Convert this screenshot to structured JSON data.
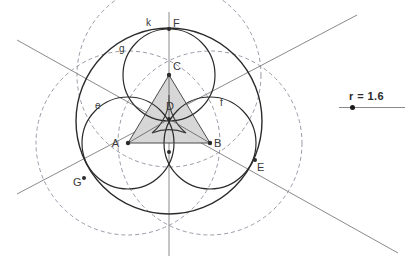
{
  "figure": {
    "background_color": "#ffffff",
    "stroke_color": "#2b2b2b",
    "dashed_color": "#9a9aa8",
    "line_color": "#8a8a8a",
    "fill_color": "#d6d6d6",
    "point_labels": [
      {
        "name": "A",
        "x": 128,
        "y": 143,
        "label_x": 119,
        "label_y": 147
      },
      {
        "name": "B",
        "x": 210,
        "y": 143,
        "label_x": 214,
        "label_y": 147
      },
      {
        "name": "C",
        "x": 169,
        "y": 75,
        "label_x": 172,
        "label_y": 70
      },
      {
        "name": "D",
        "x": 169,
        "y": 119,
        "label_x": 166,
        "label_y": 110
      },
      {
        "name": "E",
        "x": 255,
        "y": 160,
        "label_x": 256,
        "label_y": 170
      },
      {
        "name": "F",
        "x": 169,
        "y": 29,
        "label_x": 172,
        "label_y": 26
      },
      {
        "name": "G",
        "x": 84,
        "y": 178,
        "label_x": 74,
        "label_y": 185
      }
    ],
    "object_labels": [
      {
        "name": "k",
        "x": 146,
        "y": 25
      },
      {
        "name": "g",
        "x": 120,
        "y": 50
      },
      {
        "name": "e",
        "x": 97,
        "y": 108
      },
      {
        "name": "f",
        "x": 221,
        "y": 105
      }
    ],
    "circles_solid": [
      {
        "name": "k",
        "cx": 169,
        "cy": 121,
        "r": 93
      },
      {
        "name": "g",
        "cx": 169,
        "cy": 75,
        "r": 46
      },
      {
        "name": "e",
        "cx": 128,
        "cy": 143,
        "r": 46
      },
      {
        "name": "f",
        "cx": 210,
        "cy": 143,
        "r": 46
      }
    ],
    "circles_dashed": [
      {
        "center": "A",
        "cx": 128,
        "cy": 143,
        "r": 92
      },
      {
        "center": "B",
        "cx": 210,
        "cy": 143,
        "r": 92
      },
      {
        "center": "C",
        "cx": 169,
        "cy": 75,
        "r": 92
      }
    ],
    "triangle": {
      "points": "128,143 210,143 169,75"
    },
    "lines": [
      {
        "name": "vertical-axis",
        "x1": 169,
        "y1": 12,
        "x2": 169,
        "y2": 256
      },
      {
        "name": "diagonal-up-right",
        "x1": 17,
        "y1": 194,
        "x2": 357,
        "y2": 15
      },
      {
        "name": "diagonal-down-right",
        "x1": 17,
        "y1": 40,
        "x2": 398,
        "y2": 253
      }
    ]
  },
  "slider": {
    "label": "r = 1.6",
    "value": 1.6,
    "knob_position_pct": 18,
    "x": 339,
    "y": 90
  }
}
